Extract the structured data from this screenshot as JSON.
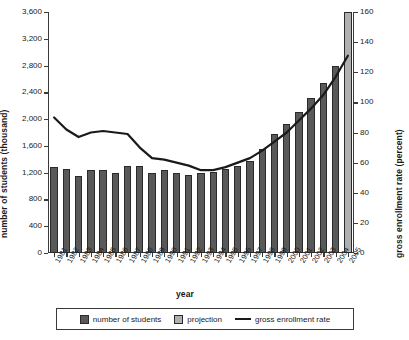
{
  "chart_data": {
    "type": "bar",
    "title": "",
    "xlabel": "year",
    "ylabel": "number of students (thousand)",
    "y2label": "gross enrollment rate (percent)",
    "categories": [
      "1981",
      "1982",
      "1983",
      "1984",
      "1985",
      "1986",
      "1987",
      "1988",
      "1989",
      "1990",
      "1991",
      "1992",
      "1993",
      "1994",
      "1995",
      "1996",
      "1997",
      "1998",
      "1999",
      "2000",
      "2001",
      "2002",
      "2003",
      "2004",
      "2005"
    ],
    "ylim": [
      0,
      3600
    ],
    "y2lim": [
      0,
      160
    ],
    "yticks": [
      "0",
      "400",
      "800",
      "1,200",
      "1,600",
      "2,000",
      "2,400",
      "2,800",
      "3,200",
      "3,600"
    ],
    "y2ticks": [
      "0",
      "20",
      "40",
      "60",
      "80",
      "100",
      "120",
      "140",
      "160"
    ],
    "grid": false,
    "legend_position": "bottom",
    "series": [
      {
        "name": "number of students",
        "type": "bar",
        "color": "#595959",
        "values": [
          1280,
          1250,
          1150,
          1240,
          1240,
          1200,
          1300,
          1300,
          1200,
          1240,
          1190,
          1170,
          1200,
          1210,
          1260,
          1300,
          1380,
          1550,
          1780,
          1920,
          2100,
          2320,
          2540,
          2790,
          3090
        ]
      },
      {
        "name": "projection",
        "type": "bar",
        "color": "#b0b0b0",
        "values": [
          null,
          null,
          null,
          null,
          null,
          null,
          null,
          null,
          null,
          null,
          null,
          null,
          null,
          null,
          null,
          null,
          null,
          null,
          null,
          null,
          null,
          null,
          null,
          null,
          3600
        ],
        "projection_year": "2005"
      },
      {
        "name": "gross enrollment rate",
        "type": "line",
        "axis": "right",
        "color": "#1a1a1a",
        "values": [
          90,
          82,
          77,
          80,
          81,
          80,
          79,
          70,
          63,
          62,
          60,
          58,
          55,
          55,
          57,
          60,
          63,
          68,
          74,
          80,
          88,
          96,
          105,
          117,
          131
        ]
      }
    ]
  },
  "legend": {
    "items": [
      {
        "label": "number of students",
        "kind": "swatch-actual"
      },
      {
        "label": "projection",
        "kind": "swatch-projection"
      },
      {
        "label": "gross enrollment rate",
        "kind": "swatch-line"
      }
    ]
  }
}
